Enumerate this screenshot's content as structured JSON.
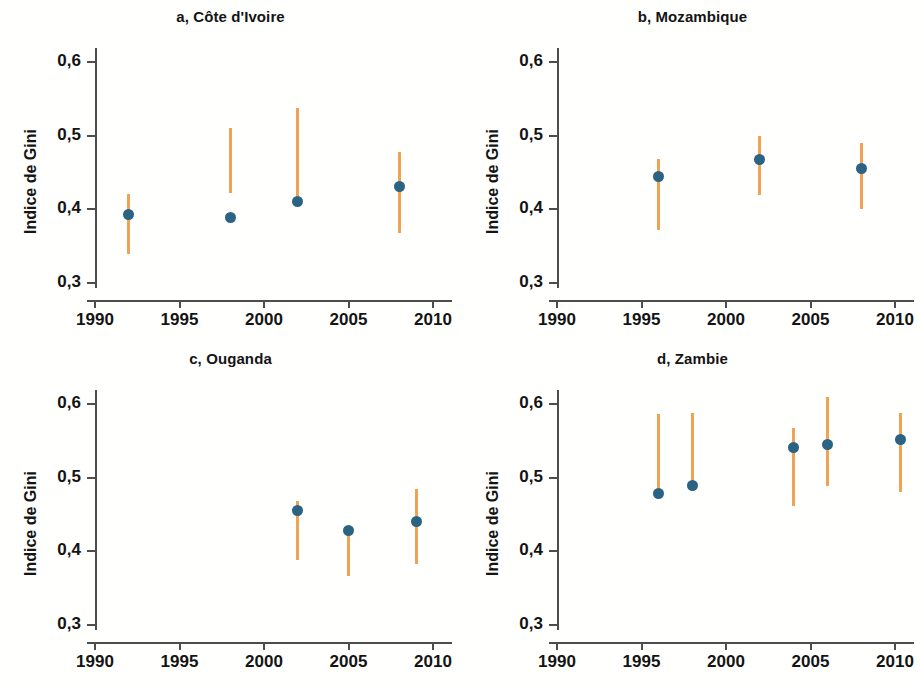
{
  "figure": {
    "ylabel": "Indice de Gini",
    "colors": {
      "point": "#2b6382",
      "interval": "#f0a355",
      "axis": "#4d4d4d",
      "background": "#fffffe"
    },
    "y_ticks": [
      "0,3",
      "0,4",
      "0,5",
      "0,6"
    ],
    "x_ticks": [
      "1990",
      "1995",
      "2000",
      "2005",
      "2010"
    ]
  },
  "chart_data": [
    {
      "type": "scatter",
      "title": "a, Côte d'Ivoire",
      "panel": "a",
      "xlabel": "",
      "ylabel": "Indice de Gini",
      "xlim": [
        1987.5,
        2011.5
      ],
      "ylim": [
        0.3,
        0.63
      ],
      "ytick_values": [
        0.3,
        0.4,
        0.5,
        0.6
      ],
      "ytick_labels": [
        "0,3",
        "0,4",
        "0,5",
        "0,6"
      ],
      "xtick_values": [
        1990,
        1995,
        2000,
        2005,
        2010
      ],
      "xtick_labels": [
        "1990",
        "1995",
        "2000",
        "2005",
        "2010"
      ],
      "grid": false,
      "legend": "none",
      "x": [
        1992,
        1998,
        2002,
        2008
      ],
      "values": [
        0.393,
        0.389,
        0.411,
        0.431
      ],
      "interval_low": [
        0.34,
        0.422,
        0.404,
        0.368
      ],
      "interval_high": [
        0.421,
        0.511,
        0.537,
        0.478
      ]
    },
    {
      "type": "scatter",
      "title": "b, Mozambique",
      "panel": "b",
      "xlabel": "",
      "ylabel": "Indice de Gini",
      "xlim": [
        1987.5,
        2011.5
      ],
      "ylim": [
        0.3,
        0.63
      ],
      "ytick_values": [
        0.3,
        0.4,
        0.5,
        0.6
      ],
      "ytick_labels": [
        "0,3",
        "0,4",
        "0,5",
        "0,6"
      ],
      "xtick_values": [
        1990,
        1995,
        2000,
        2005,
        2010
      ],
      "xtick_labels": [
        "1990",
        "1995",
        "2000",
        "2005",
        "2010"
      ],
      "grid": false,
      "legend": "none",
      "x": [
        1996,
        2002,
        2008
      ],
      "values": [
        0.444,
        0.468,
        0.455
      ],
      "interval_low": [
        0.372,
        0.42,
        0.401
      ],
      "interval_high": [
        0.468,
        0.5,
        0.49
      ]
    },
    {
      "type": "scatter",
      "title": "c, Ouganda",
      "panel": "c",
      "xlabel": "",
      "ylabel": "Indice de Gini",
      "xlim": [
        1987.5,
        2011.5
      ],
      "ylim": [
        0.3,
        0.63
      ],
      "ytick_values": [
        0.3,
        0.4,
        0.5,
        0.6
      ],
      "ytick_labels": [
        "0,3",
        "0,4",
        "0,5",
        "0,6"
      ],
      "xtick_values": [
        1990,
        1995,
        2000,
        2005,
        2010
      ],
      "xtick_labels": [
        "1990",
        "1995",
        "2000",
        "2005",
        "2010"
      ],
      "grid": false,
      "legend": "none",
      "x": [
        2002,
        2005,
        2009
      ],
      "values": [
        0.456,
        0.428,
        0.441
      ],
      "interval_low": [
        0.388,
        0.367,
        0.383
      ],
      "interval_high": [
        0.469,
        0.43,
        0.484
      ]
    },
    {
      "type": "scatter",
      "title": "d, Zambie",
      "panel": "d",
      "xlabel": "",
      "ylabel": "Indice de Gini",
      "xlim": [
        1987.5,
        2011.5
      ],
      "ylim": [
        0.3,
        0.63
      ],
      "ytick_values": [
        0.3,
        0.4,
        0.5,
        0.6
      ],
      "ytick_labels": [
        "0,3",
        "0,4",
        "0,5",
        "0,6"
      ],
      "xtick_values": [
        1990,
        1995,
        2000,
        2005,
        2010
      ],
      "xtick_labels": [
        "1990",
        "1995",
        "2000",
        "2005",
        "2010"
      ],
      "grid": false,
      "legend": "none",
      "x": [
        1996,
        1998,
        2004,
        2006,
        2010.3
      ],
      "values": [
        0.478,
        0.489,
        0.541,
        0.545,
        0.552
      ],
      "interval_low": [
        0.478,
        0.489,
        0.462,
        0.489,
        0.48
      ],
      "interval_high": [
        0.586,
        0.588,
        0.567,
        0.609,
        0.588
      ]
    }
  ]
}
